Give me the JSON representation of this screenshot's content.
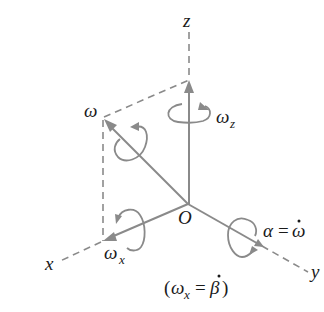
{
  "diagram": {
    "type": "3D angular velocity vector decomposition",
    "axes": {
      "z": "z",
      "x": "x",
      "y": "y",
      "origin": "O"
    },
    "vectors": {
      "omega": "ω",
      "omega_z": "ω",
      "omega_z_sub": "z",
      "omega_x": "ω",
      "omega_x_sub": "x",
      "alpha_lhs": "α",
      "alpha_eq": "=",
      "alpha_rhs": "ω"
    },
    "caption": {
      "open": "(",
      "omega": "ω",
      "sub": "x",
      "eq": "=",
      "beta": "β",
      "close": ")"
    },
    "colors": {
      "lines": "#8a8a8a",
      "text": "#1a1a1a",
      "background": "#ffffff"
    }
  }
}
